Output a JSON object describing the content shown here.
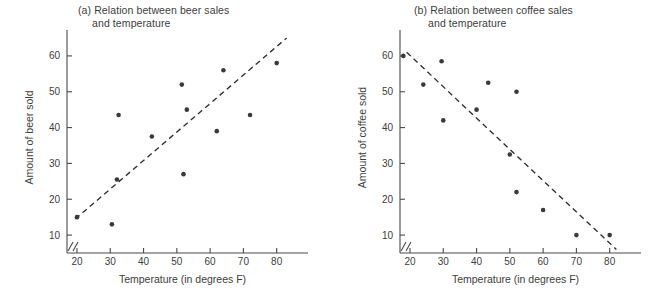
{
  "figure": {
    "background": "#ffffff",
    "point_color": "#3a3a3a",
    "line_color": "#2e2e2e",
    "axis_color": "#4a4a4a"
  },
  "chart_data": [
    {
      "type": "scatter",
      "panel": "a",
      "title": "(a) Relation between beer sales",
      "title_line2": "and temperature",
      "xlabel": "Temperature (in degrees F)",
      "ylabel": "Amount of beer sold",
      "xlim": [
        17,
        84
      ],
      "ylim": [
        5,
        65
      ],
      "xticks": [
        20,
        30,
        40,
        50,
        60,
        70,
        80
      ],
      "yticks": [
        10,
        20,
        30,
        40,
        50,
        60
      ],
      "xtick_labels": [
        "20",
        "30",
        "40",
        "50",
        "60",
        "70",
        "80"
      ],
      "ytick_labels": [
        "10",
        "20",
        "30",
        "40",
        "50",
        "60"
      ],
      "axis_break": true,
      "grid": false,
      "legend": "none",
      "x": [
        20.0,
        30.5,
        32.0,
        32.5,
        42.5,
        51.5,
        52.0,
        53.0,
        62.0,
        64.0,
        72.0,
        80.0
      ],
      "y": [
        15.0,
        13.0,
        25.5,
        43.5,
        37.5,
        52.0,
        27.0,
        45.0,
        39.0,
        56.0,
        43.5,
        58.0
      ],
      "trendline": {
        "style": "dashed",
        "x": [
          19.5,
          83.0
        ],
        "y": [
          14.5,
          65.0
        ]
      }
    },
    {
      "type": "scatter",
      "panel": "b",
      "title": "(b) Relation between coffee sales",
      "title_line2": "and temperature",
      "xlabel": "Temperature (in degrees F)",
      "ylabel": "Amount of coffee sold",
      "xlim": [
        17,
        84
      ],
      "ylim": [
        5,
        65
      ],
      "xticks": [
        20,
        30,
        40,
        50,
        60,
        70,
        80
      ],
      "yticks": [
        10,
        20,
        30,
        40,
        50,
        60
      ],
      "xtick_labels": [
        "20",
        "30",
        "40",
        "50",
        "60",
        "70",
        "80"
      ],
      "ytick_labels": [
        "10",
        "20",
        "30",
        "40",
        "50",
        "60"
      ],
      "axis_break": true,
      "grid": false,
      "legend": "none",
      "x": [
        18.0,
        24.0,
        29.5,
        30.0,
        40.0,
        43.5,
        50.0,
        52.0,
        52.0,
        60.0,
        70.0,
        80.0
      ],
      "y": [
        60.0,
        52.0,
        58.5,
        42.0,
        45.0,
        52.5,
        32.5,
        50.0,
        22.0,
        17.0,
        10.0,
        10.0
      ],
      "trendline": {
        "style": "dashed",
        "x": [
          19.0,
          82.0
        ],
        "y": [
          61.0,
          6.0
        ]
      }
    }
  ]
}
